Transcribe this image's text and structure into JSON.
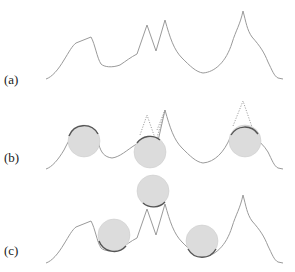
{
  "figure": {
    "panels": [
      {
        "id": "a",
        "label": "(a)",
        "description": "original curve"
      },
      {
        "id": "b",
        "label": "(b)",
        "description": "curve with balls rolled under peaks; peaks shown dotted"
      },
      {
        "id": "c",
        "label": "(c)",
        "description": "curve with balls resting in valleys; one ball atop double peak"
      }
    ],
    "colors": {
      "curve": "#9a9a9a",
      "ball_fill": "#dcdcdc",
      "contact_arc": "#555555",
      "label": "#222222"
    }
  }
}
